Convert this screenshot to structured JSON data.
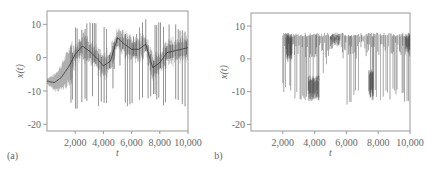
{
  "figure": {
    "panels": [
      {
        "label": "(a)",
        "ylabel": "x(t)",
        "xlabel": "t"
      },
      {
        "label": "(b)",
        "ylabel": "x(t)",
        "xlabel": "t"
      }
    ]
  },
  "chart_data": [
    {
      "type": "line",
      "panel": "(a)",
      "title": "",
      "xlabel": "t",
      "ylabel": "x(t)",
      "xlim": [
        0,
        10000
      ],
      "ylim": [
        -22,
        14
      ],
      "xticks": [
        2000,
        4000,
        6000,
        8000,
        10000
      ],
      "xtick_labels": [
        "2,000",
        "4,000",
        "6,000",
        "8,000",
        "10,000"
      ],
      "yticks": [
        10,
        0,
        -10,
        -20
      ],
      "ytick_labels": [
        "10",
        "0",
        "-10",
        "-20"
      ],
      "grid": false,
      "legend": null,
      "color": "#444444",
      "description": "Chaotic time series; slow drifting mean curve with dense oscillation envelope and intermittent bursts reaching ~+11 and ~-17",
      "series": [
        {
          "name": "envelope_mean",
          "x": [
            0,
            500,
            1000,
            1500,
            2000,
            2500,
            3000,
            3500,
            4000,
            4500,
            5000,
            5500,
            6000,
            6500,
            7000,
            7500,
            8000,
            8500,
            9000,
            9500,
            10000
          ],
          "values": [
            -7,
            -7.5,
            -6,
            -3,
            1,
            3.5,
            2,
            0,
            -2.5,
            -1,
            6,
            4,
            2.5,
            2.5,
            4,
            -3,
            -1.5,
            1.5,
            2,
            2.5,
            3
          ]
        },
        {
          "name": "upper_envelope",
          "x": [
            0,
            500,
            1000,
            1500,
            2000,
            2500,
            3000,
            3500,
            4000,
            4500,
            5000,
            5500,
            6000,
            6500,
            7000,
            7500,
            8000,
            8500,
            9000,
            9500,
            10000
          ],
          "values": [
            -6,
            -5,
            -3,
            2,
            10,
            10,
            10.5,
            11,
            11,
            10,
            7.5,
            9,
            8,
            9,
            12,
            10,
            11,
            10,
            10.5,
            10,
            8
          ]
        },
        {
          "name": "lower_envelope",
          "x": [
            0,
            500,
            1000,
            1500,
            2000,
            2500,
            3000,
            3500,
            4000,
            4500,
            5000,
            5500,
            6000,
            6500,
            7000,
            7500,
            8000,
            8500,
            9000,
            9500,
            10000
          ],
          "values": [
            -8,
            -9,
            -11,
            -14,
            -16,
            -15,
            -14,
            -15,
            -14,
            -17,
            4,
            -15,
            -14,
            -14,
            -15,
            -13,
            -15,
            -14,
            -15,
            -16,
            -14
          ]
        }
      ]
    },
    {
      "type": "line",
      "panel": "(b)",
      "title": "",
      "xlabel": "t",
      "ylabel": "x(t)",
      "xlim": [
        0,
        10000
      ],
      "ylim": [
        -22,
        14
      ],
      "xticks": [
        2000,
        4000,
        6000,
        8000,
        10000
      ],
      "xtick_labels": [
        "2,000",
        "4,000",
        "6,000",
        "8,000",
        "10,000"
      ],
      "yticks": [
        10,
        0,
        -10,
        -20
      ],
      "ytick_labels": [
        "10",
        "0",
        "-10",
        "-20"
      ],
      "grid": false,
      "legend": null,
      "color": "#444444",
      "description": "Signal starts at t~2000, clipped at ~+8, intermittent drops to ~-13",
      "series": [
        {
          "name": "upper_envelope",
          "x": [
            2000,
            3000,
            4000,
            5000,
            6000,
            7000,
            8000,
            9000,
            10000
          ],
          "values": [
            8,
            8,
            8,
            8,
            8,
            8,
            8,
            8,
            8
          ]
        },
        {
          "name": "lower_envelope",
          "x": [
            2000,
            3000,
            4000,
            5000,
            6000,
            7000,
            8000,
            9000,
            10000
          ],
          "values": [
            -11,
            -13,
            -13,
            2,
            -14,
            -13,
            -13,
            -13,
            -14
          ]
        }
      ]
    }
  ]
}
